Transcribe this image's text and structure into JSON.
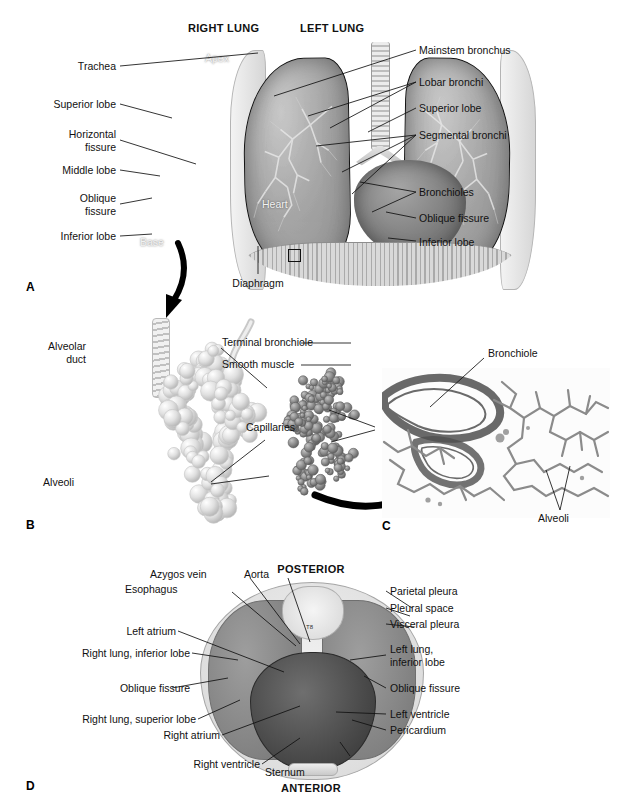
{
  "figure": {
    "panels": [
      {
        "letter": "A",
        "name": "anterior-thorax-view"
      },
      {
        "letter": "B",
        "name": "alveolar-sac-illustration"
      },
      {
        "letter": "C",
        "name": "lung-tissue-micrograph"
      },
      {
        "letter": "D",
        "name": "transverse-thorax-cross-section"
      }
    ]
  },
  "panel_a": {
    "letter": "A",
    "headers": {
      "right_lung": "RIGHT LUNG",
      "left_lung": "LEFT LUNG"
    },
    "inner_labels": {
      "apex": "Apex",
      "heart": "Heart",
      "base": "Base"
    },
    "labels_left": [
      {
        "text": "Trachea"
      },
      {
        "text": "Superior lobe"
      },
      {
        "text": "Horizontal\nfissure"
      },
      {
        "text": "Middle lobe"
      },
      {
        "text": "Oblique\nfissure"
      },
      {
        "text": "Inferior lobe"
      }
    ],
    "labels_right": [
      {
        "text": "Mainstem bronchus"
      },
      {
        "text": "Lobar bronchi"
      },
      {
        "text": "Superior lobe"
      },
      {
        "text": "Segmental bronchi"
      },
      {
        "text": "Bronchioles"
      },
      {
        "text": "Oblique fissure"
      },
      {
        "text": "Inferior lobe"
      }
    ],
    "labels_bottom": [
      {
        "text": "Diaphragm"
      }
    ]
  },
  "panel_b": {
    "letter": "B",
    "labels": [
      {
        "text": "Terminal bronchiole"
      },
      {
        "text": "Smooth muscle"
      },
      {
        "text": "Alveolar\nduct"
      },
      {
        "text": "Capillaries"
      },
      {
        "text": "Alveoli"
      }
    ]
  },
  "panel_c": {
    "letter": "C",
    "labels": [
      {
        "text": "Bronchiole"
      },
      {
        "text": "Alveoli"
      }
    ]
  },
  "panel_d": {
    "letter": "D",
    "orientation": {
      "top": "POSTERIOR",
      "bottom": "ANTERIOR"
    },
    "inner_labels": {
      "thoracic_vertebra": "T8"
    },
    "labels_top": [
      {
        "text": "Azygos vein"
      },
      {
        "text": "Aorta"
      },
      {
        "text": "Esophagus"
      }
    ],
    "labels_left": [
      {
        "text": "Left atrium"
      },
      {
        "text": "Right lung, inferior lobe"
      },
      {
        "text": "Oblique fissure"
      },
      {
        "text": "Right lung, superior lobe"
      },
      {
        "text": "Right atrium"
      },
      {
        "text": "Right ventricle"
      }
    ],
    "labels_right": [
      {
        "text": "Parietal pleura"
      },
      {
        "text": "Pleural space"
      },
      {
        "text": "Visceral pleura"
      },
      {
        "text": "Left lung,\ninferior lobe"
      },
      {
        "text": "Oblique fissure"
      },
      {
        "text": "Left ventricle"
      },
      {
        "text": "Pericardium"
      }
    ],
    "labels_bottom": [
      {
        "text": "Sternum"
      }
    ]
  },
  "colors": {
    "background": "#ffffff",
    "text": "#111111",
    "leader_line": "#111111",
    "tissue_mid": "#8d8d8d",
    "tissue_dark": "#4a4a4a",
    "tissue_light": "#dcdcdc"
  }
}
